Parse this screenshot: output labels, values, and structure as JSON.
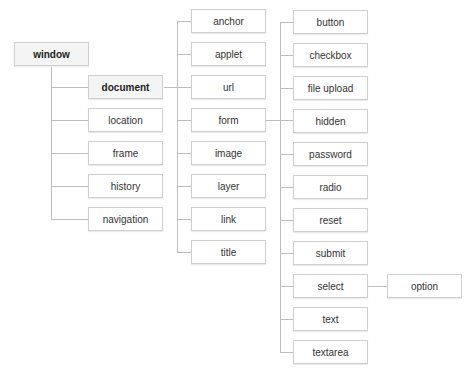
{
  "diagram": {
    "root": "window",
    "window_children": [
      "document",
      "location",
      "frame",
      "history",
      "navigation"
    ],
    "document_children": [
      "anchor",
      "applet",
      "url",
      "form",
      "image",
      "layer",
      "link",
      "title"
    ],
    "form_children": [
      "button",
      "checkbox",
      "file upload",
      "hidden",
      "password",
      "radio",
      "reset",
      "submit",
      "select",
      "text",
      "textarea"
    ],
    "select_children": [
      "option"
    ]
  }
}
